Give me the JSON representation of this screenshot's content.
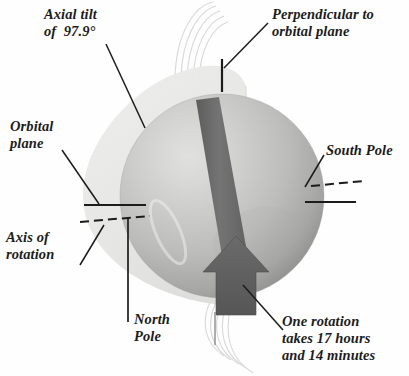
{
  "figure": {
    "background_color": "#fefefe",
    "ink_color": "#1c1c1c"
  },
  "labels": {
    "axial_tilt": "Axial tilt\nof  97.9°",
    "perpendicular": "Perpendicular to\norbital plane",
    "orbital_plane": "Orbital\nplane",
    "south_pole": "South Pole",
    "axis_of_rotation": "Axis of\nrotation",
    "north_pole": "North\nPole",
    "rotation_period": "One rotation\ntakes 17 hours\nand 14 minutes"
  },
  "values": {
    "axial_tilt_degrees": "97.9°",
    "rotation_hours": "17",
    "rotation_minutes": "14"
  },
  "colors": {
    "planet_light": "#d8d8d6",
    "planet_mid": "#bdbdbb",
    "planet_dark": "#9c9c9a",
    "orbital_disc": "#e9e9e7",
    "arrow_band": "#6e6e6e",
    "arrow_band_dark": "#5a5a5a",
    "line": "#1c1c1c",
    "ring": "#cfcfcf"
  }
}
